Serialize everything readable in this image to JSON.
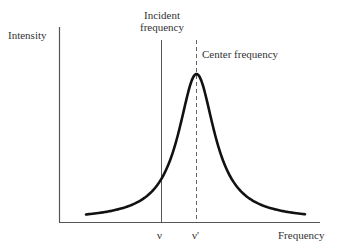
{
  "chart_data": {
    "type": "line",
    "title": "",
    "xlabel": "Frequency",
    "ylabel": "Intensity",
    "curve": "Lorentzian line shape centered at center frequency",
    "annotations": [
      {
        "label": "Incident frequency",
        "x_tick": "ν",
        "style": "solid vertical line"
      },
      {
        "label": "Center frequency",
        "x_tick": "ν'",
        "style": "dashed vertical line"
      }
    ],
    "x_ticks": [
      "ν",
      "ν'"
    ],
    "grid": false,
    "legend": "none",
    "colors": {
      "curve": "#111111",
      "axes": "#555555",
      "incident_line": "#555555",
      "center_line": "#666666"
    }
  },
  "labels": {
    "y_axis": "Intensity",
    "x_axis": "Frequency",
    "incident_line1": "Incident",
    "incident_line2": "frequency",
    "center": "Center frequency",
    "tick_nu": "ν",
    "tick_nu_prime": "ν'"
  }
}
